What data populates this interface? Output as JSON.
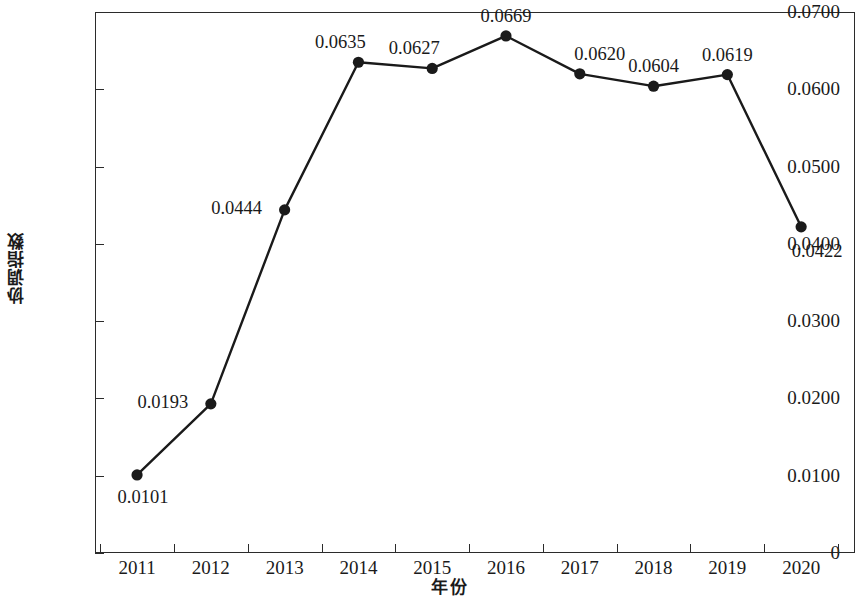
{
  "chart_data": {
    "type": "line",
    "title": "",
    "subtitle": "",
    "xlabel": "年份",
    "ylabel": "协调指数",
    "categories": [
      "2011",
      "2012",
      "2013",
      "2014",
      "2015",
      "2016",
      "2017",
      "2018",
      "2019",
      "2020"
    ],
    "values": [
      0.0101,
      0.0193,
      0.0444,
      0.0635,
      0.0627,
      0.0669,
      0.062,
      0.0604,
      0.0619,
      0.0422
    ],
    "point_labels": [
      "0.0101",
      "0.0193",
      "0.0444",
      "0.0635",
      "0.0627",
      "0.0669",
      "0.0620",
      "0.0604",
      "0.0619",
      "0.0422"
    ],
    "ylim": [
      0,
      0.07
    ],
    "ytick_labels": [
      "0.0700",
      "0.0600",
      "0.0500",
      "0.0400",
      "0.0300",
      "0.0200",
      "0.0100",
      "0"
    ],
    "ytick_values": [
      0.07,
      0.06,
      0.05,
      0.04,
      0.03,
      0.02,
      0.01,
      0
    ],
    "grid": false,
    "legend": "none",
    "marker": "filled-circle",
    "line_color": "#1a1a1a",
    "marker_color": "#1a1a1a",
    "background_color": "#ffffff"
  },
  "axes": {
    "y_title": "协调指数",
    "x_title": "年份",
    "y_ticks": [
      {
        "label": "0.0700",
        "value": 0.07
      },
      {
        "label": "0.0600",
        "value": 0.06
      },
      {
        "label": "0.0500",
        "value": 0.05
      },
      {
        "label": "0.0400",
        "value": 0.04
      },
      {
        "label": "0.0300",
        "value": 0.03
      },
      {
        "label": "0.0200",
        "value": 0.02
      },
      {
        "label": "0.0100",
        "value": 0.01
      },
      {
        "label": "0",
        "value": 0
      }
    ],
    "x_ticks": [
      {
        "label": "2011"
      },
      {
        "label": "2012"
      },
      {
        "label": "2013"
      },
      {
        "label": "2014"
      },
      {
        "label": "2015"
      },
      {
        "label": "2016"
      },
      {
        "label": "2017"
      },
      {
        "label": "2018"
      },
      {
        "label": "2019"
      },
      {
        "label": "2020"
      }
    ]
  },
  "points": [
    {
      "x": "2011",
      "y": 0.0101,
      "label": "0.0101",
      "label_pos": "below"
    },
    {
      "x": "2012",
      "y": 0.0193,
      "label": "0.0193",
      "label_pos": "left"
    },
    {
      "x": "2013",
      "y": 0.0444,
      "label": "0.0444",
      "label_pos": "left"
    },
    {
      "x": "2014",
      "y": 0.0635,
      "label": "0.0635",
      "label_pos": "above-left"
    },
    {
      "x": "2015",
      "y": 0.0627,
      "label": "0.0627",
      "label_pos": "above-left"
    },
    {
      "x": "2016",
      "y": 0.0669,
      "label": "0.0669",
      "label_pos": "above"
    },
    {
      "x": "2017",
      "y": 0.062,
      "label": "0.0620",
      "label_pos": "above-right"
    },
    {
      "x": "2018",
      "y": 0.0604,
      "label": "0.0604",
      "label_pos": "above"
    },
    {
      "x": "2019",
      "y": 0.0619,
      "label": "0.0619",
      "label_pos": "above"
    },
    {
      "x": "2020",
      "y": 0.0422,
      "label": "0.0422",
      "label_pos": "below-left"
    }
  ]
}
